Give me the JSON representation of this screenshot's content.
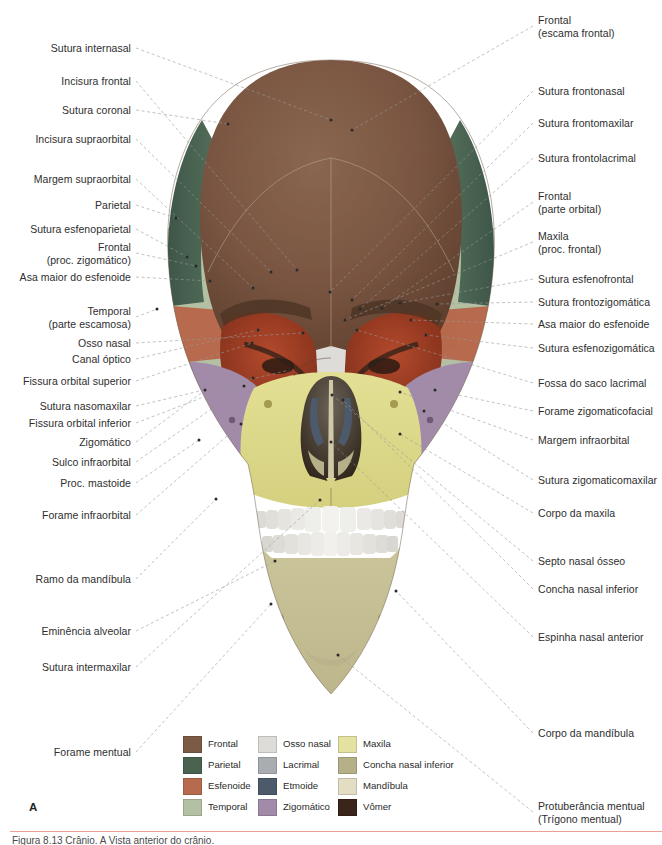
{
  "figure": {
    "panel_label": "A",
    "caption": "Figura 8.13  Crânio. A Vista anterior do crânio."
  },
  "labels_left": [
    {
      "text": "Sutura internasal",
      "x": 131,
      "y": 42,
      "tx": 331,
      "ty": 120
    },
    {
      "text": "Incisura frontal",
      "x": 131,
      "y": 75,
      "tx": 297,
      "ty": 270
    },
    {
      "text": "Sutura coronal",
      "x": 131,
      "y": 104,
      "tx": 228,
      "ty": 124
    },
    {
      "text": "Incisura supraorbital",
      "x": 131,
      "y": 133,
      "tx": 271,
      "ty": 272
    },
    {
      "text": "Margem supraorbital",
      "x": 131,
      "y": 173,
      "tx": 253,
      "ty": 288
    },
    {
      "text": "Parietal",
      "x": 131,
      "y": 199,
      "tx": 176,
      "ty": 218
    },
    {
      "text": "Sutura esfenoparietal",
      "x": 131,
      "y": 223,
      "tx": 187,
      "ty": 257
    },
    {
      "text": "Frontal\n(proc. zigomático)",
      "x": 131,
      "y": 241,
      "tx": 196,
      "ty": 266
    },
    {
      "text": "Asa maior do esfenoide",
      "x": 131,
      "y": 271,
      "tx": 210,
      "ty": 281
    },
    {
      "text": "Temporal\n(parte escamosa)",
      "x": 131,
      "y": 305,
      "tx": 157,
      "ty": 309
    },
    {
      "text": "Osso nasal",
      "x": 131,
      "y": 337,
      "tx": 303,
      "ty": 333
    },
    {
      "text": "Canal óptico",
      "x": 131,
      "y": 353,
      "tx": 258,
      "ty": 330
    },
    {
      "text": "Fissura orbital superior",
      "x": 131,
      "y": 375,
      "tx": 252,
      "ty": 343
    },
    {
      "text": "Sutura nasomaxilar",
      "x": 131,
      "y": 400,
      "tx": 290,
      "ty": 370
    },
    {
      "text": "Fissura orbital inferior",
      "x": 131,
      "y": 417,
      "tx": 253,
      "ty": 378
    },
    {
      "text": "Zigomático",
      "x": 131,
      "y": 436,
      "tx": 205,
      "ty": 390
    },
    {
      "text": "Sulco infraorbital",
      "x": 131,
      "y": 456,
      "tx": 244,
      "ty": 386
    },
    {
      "text": "Proc. mastoide",
      "x": 131,
      "y": 477,
      "tx": 199,
      "ty": 440
    },
    {
      "text": "Forame infraorbital",
      "x": 131,
      "y": 509,
      "tx": 241,
      "ty": 424
    },
    {
      "text": "Ramo da mandíbula",
      "x": 131,
      "y": 573,
      "tx": 216,
      "ty": 499
    },
    {
      "text": "Eminência alveolar",
      "x": 131,
      "y": 625,
      "tx": 275,
      "ty": 561
    },
    {
      "text": "Sutura intermaxilar",
      "x": 131,
      "y": 661,
      "tx": 320,
      "ty": 500
    },
    {
      "text": "Forame mentual",
      "x": 131,
      "y": 746,
      "tx": 271,
      "ty": 604
    }
  ],
  "labels_right": [
    {
      "text": "Frontal\n(escama frontal)",
      "x": 538,
      "y": 14,
      "tx": 352,
      "ty": 130
    },
    {
      "text": "Sutura frontonasal",
      "x": 538,
      "y": 85,
      "tx": 330,
      "ty": 292
    },
    {
      "text": "Sutura frontomaxilar",
      "x": 538,
      "y": 117,
      "tx": 352,
      "ty": 300
    },
    {
      "text": "Sutura frontolacrimal",
      "x": 538,
      "y": 152,
      "tx": 360,
      "ty": 309
    },
    {
      "text": "Frontal\n(parte orbital)",
      "x": 538,
      "y": 190,
      "tx": 382,
      "ty": 308
    },
    {
      "text": "Maxila\n(proc. frontal)",
      "x": 538,
      "y": 230,
      "tx": 345,
      "ty": 320
    },
    {
      "text": "Sutura esfenofrontal",
      "x": 538,
      "y": 273,
      "tx": 400,
      "ty": 303
    },
    {
      "text": "Sutura frontozigomática",
      "x": 538,
      "y": 296,
      "tx": 437,
      "ty": 304
    },
    {
      "text": "Asa maior do esfenoide",
      "x": 538,
      "y": 318,
      "tx": 411,
      "ty": 320
    },
    {
      "text": "Sutura esfenozigomática",
      "x": 538,
      "y": 342,
      "tx": 426,
      "ty": 335
    },
    {
      "text": "Fossa do saco lacrimal",
      "x": 538,
      "y": 377,
      "tx": 357,
      "ty": 330
    },
    {
      "text": "Forame zigomaticofacial",
      "x": 538,
      "y": 405,
      "tx": 435,
      "ty": 390
    },
    {
      "text": "Margem infraorbital",
      "x": 538,
      "y": 434,
      "tx": 400,
      "ty": 392
    },
    {
      "text": "Sutura zigomaticomaxilar",
      "x": 538,
      "y": 474,
      "tx": 424,
      "ty": 411
    },
    {
      "text": "Corpo da maxila",
      "x": 538,
      "y": 507,
      "tx": 400,
      "ty": 434
    },
    {
      "text": "Septo nasal ósseo",
      "x": 538,
      "y": 555,
      "tx": 332,
      "ty": 395
    },
    {
      "text": "Concha nasal inferior",
      "x": 538,
      "y": 583,
      "tx": 343,
      "ty": 400
    },
    {
      "text": "Espinha nasal anterior",
      "x": 538,
      "y": 631,
      "tx": 331,
      "ty": 442
    },
    {
      "text": "Corpo da mandíbula",
      "x": 538,
      "y": 727,
      "tx": 396,
      "ty": 591
    },
    {
      "text": "Protuberância mentual\n(Trígono mentual)",
      "x": 538,
      "y": 800,
      "tx": 338,
      "ty": 655
    }
  ],
  "legend": {
    "columns": [
      {
        "x": 0,
        "items": [
          {
            "label": "Frontal",
            "color": "#7d5a44"
          },
          {
            "label": "Parietal",
            "color": "#4a6351"
          },
          {
            "label": "Esfenoide",
            "color": "#b76a4d"
          },
          {
            "label": "Temporal",
            "color": "#b4c0a3"
          }
        ]
      },
      {
        "x": 75,
        "items": [
          {
            "label": "Osso nasal",
            "color": "#dddcd8"
          },
          {
            "label": "Lacrimal",
            "color": "#a9adb1"
          },
          {
            "label": "Etmoide",
            "color": "#4d5a6b"
          },
          {
            "label": "Zigomático",
            "color": "#a18ba9"
          }
        ]
      },
      {
        "x": 155,
        "items": [
          {
            "label": "Maxila",
            "color": "#e4e1a1"
          },
          {
            "label": "Concha nasal inferior",
            "color": "#b5b087"
          },
          {
            "label": "Mandíbula",
            "color": "#e3ddc3"
          },
          {
            "label": "Vômer",
            "color": "#3b2419"
          }
        ]
      }
    ]
  },
  "skull_colors": {
    "frontal": "#7d5a44",
    "parietal": "#4a6351",
    "sphenoid": "#b76a4d",
    "temporal": "#b4c0a3",
    "zygomatic": "#a18ba9",
    "maxilla": "#e0dc8e",
    "mandible": "#cdc79c",
    "nasal": "#dddcd8",
    "ethmoid": "#4d5a6b",
    "vomer": "#3b2419",
    "orbit": "#9e3b24",
    "teeth": "#f2f1ed",
    "leader": "#9a9a9a"
  }
}
